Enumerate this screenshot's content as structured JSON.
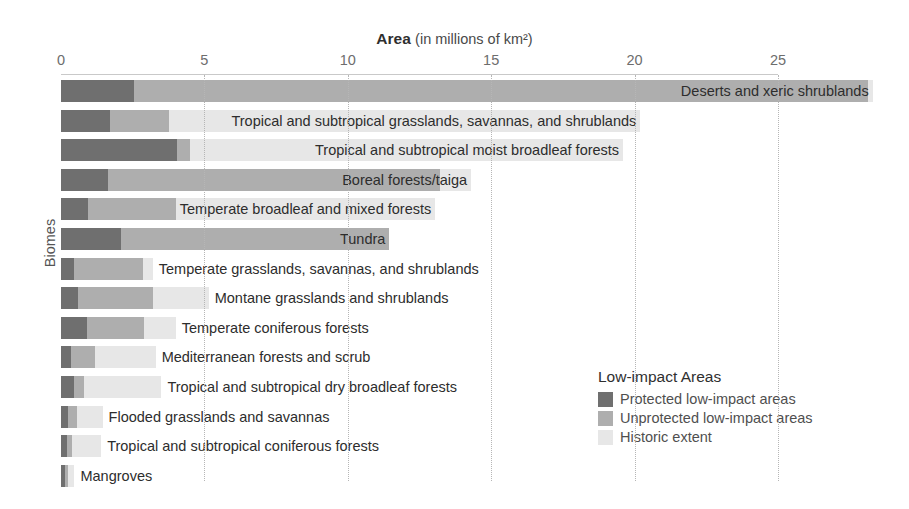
{
  "chart_data": {
    "type": "bar",
    "orientation": "horizontal",
    "stacked": true,
    "title": "Area (in millions of km²)",
    "title_strong": "Area",
    "title_light": "(in millions of km²)",
    "xlabel": "Area (in millions of km²)",
    "ylabel": "Biomes",
    "xlim": [
      0,
      28.5
    ],
    "xticks": [
      0,
      5,
      10,
      15,
      20,
      25
    ],
    "xtick_labels": [
      "0",
      "5",
      "10",
      "15",
      "20",
      "25"
    ],
    "grid": "vertical-dotted",
    "legend_position": "bottom-right",
    "legend_title": "Low-impact Areas",
    "series": [
      {
        "name": "Protected low-impact areas",
        "color": "#6f6f6f",
        "values": [
          2.55,
          1.7,
          4.05,
          2.2,
          0.95,
          2.1,
          0.45,
          0.6,
          0.9,
          0.35,
          0.45,
          0.25,
          0.2,
          0.15
        ]
      },
      {
        "name": "Unprotected low-impact areas",
        "color": "#aeaeae",
        "values": [
          25.6,
          2.05,
          0.45,
          11.55,
          3.05,
          9.35,
          2.4,
          2.6,
          2.0,
          0.85,
          0.35,
          0.3,
          0.2,
          0.1
        ]
      },
      {
        "name": "Historic extent",
        "color": "#e7e7e7",
        "values": [
          0.15,
          16.45,
          15.1,
          1.1,
          9.05,
          0.0,
          10.3,
          5.15,
          3.2,
          4.05,
          4.0,
          2.9,
          1.8,
          0.35
        ]
      }
    ],
    "categories": [
      "Deserts and xeric shrublands",
      "Tropical and subtropical grasslands, savannas, and shrublands",
      "Tropical and subtropical moist broadleaf forests",
      "Boreal forests/taiga",
      "Temperate broadleaf and mixed forests",
      "Tundra",
      "Temperate grasslands, savannas, and shrublands",
      "Montane grasslands and shrublands",
      "Temperate coniferous forests",
      "Mediterranean forests and scrub",
      "Tropical and subtropical dry broadleaf forests",
      "Flooded grasslands and savannas",
      "Tropical and subtropical coniferous forests",
      "Mangroves"
    ],
    "bars": [
      {
        "label": "Deserts and xeric shrublands",
        "protected": 2.55,
        "unprotected": 25.6,
        "historic": 0.15
      },
      {
        "label": "Tropical and subtropical grasslands, savannas, and shrublands",
        "protected": 1.7,
        "unprotected": 2.05,
        "historic": 16.45
      },
      {
        "label": "Tropical and subtropical moist broadleaf forests",
        "protected": 4.05,
        "unprotected": 0.45,
        "historic": 15.1
      },
      {
        "label": "Boreal forests/taiga",
        "protected": 1.65,
        "unprotected": 11.55,
        "historic": 1.1
      },
      {
        "label": "Temperate broadleaf and mixed forests",
        "protected": 0.95,
        "unprotected": 3.05,
        "historic": 9.05
      },
      {
        "label": "Tundra",
        "protected": 2.1,
        "unprotected": 9.35,
        "historic": 0.0
      },
      {
        "label": "Temperate grasslands, savannas, and shrublands",
        "protected": 0.45,
        "unprotected": 2.4,
        "historic": 0.35
      },
      {
        "label": "Montane grasslands and shrublands",
        "protected": 0.6,
        "unprotected": 2.6,
        "historic": 1.95
      },
      {
        "label": "Temperate coniferous forests",
        "protected": 0.9,
        "unprotected": 2.0,
        "historic": 1.1
      },
      {
        "label": "Mediterranean forests and scrub",
        "protected": 0.35,
        "unprotected": 0.85,
        "historic": 2.1
      },
      {
        "label": "Tropical and subtropical dry broadleaf forests",
        "protected": 0.45,
        "unprotected": 0.35,
        "historic": 2.7
      },
      {
        "label": "Flooded grasslands and savannas",
        "protected": 0.25,
        "unprotected": 0.3,
        "historic": 0.9
      },
      {
        "label": "Tropical and subtropical coniferous forests",
        "protected": 0.2,
        "unprotected": 0.2,
        "historic": 1.0
      },
      {
        "label": "Mangroves",
        "protected": 0.15,
        "unprotected": 0.1,
        "historic": 0.22
      }
    ]
  },
  "legend": {
    "title": "Low-impact Areas",
    "items": [
      {
        "label": "Protected low-impact areas",
        "color": "#6f6f6f"
      },
      {
        "label": "Unprotected low-impact areas",
        "color": "#aeaeae"
      },
      {
        "label": "Historic extent",
        "color": "#e7e7e7"
      }
    ]
  }
}
